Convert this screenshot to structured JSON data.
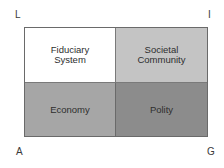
{
  "corners": {
    "top_left": "L",
    "top_right": "I",
    "bottom_left": "A",
    "bottom_right": "G"
  },
  "cells": [
    {
      "line1": "Fiduciary",
      "line2": "System",
      "color": "#ffffff"
    },
    {
      "line1": "Societal",
      "line2": "Community",
      "color": "#c4c4c4"
    },
    {
      "line1": "Economy",
      "line2": "",
      "color": "#a6a6a6"
    },
    {
      "line1": "Polity",
      "line2": "",
      "color": "#8c8c8c"
    }
  ]
}
